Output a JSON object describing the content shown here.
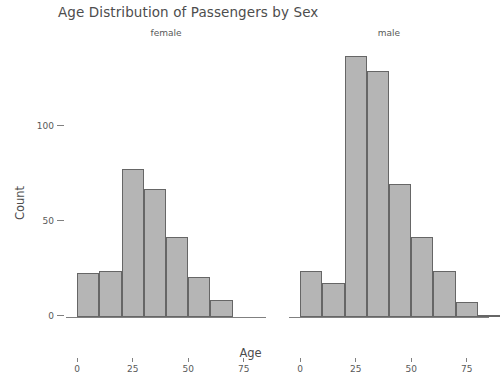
{
  "chart_data": {
    "type": "bar",
    "title": "Age Distribution of Passengers by Sex",
    "xlabel": "Age",
    "ylabel": "Count",
    "grid": false,
    "legend": "none",
    "facet_variable": "Sex",
    "bin_width": 10,
    "xlim": [
      -5,
      85
    ],
    "ylim": [
      0,
      145
    ],
    "x_ticks": [
      "0",
      "25",
      "50",
      "75"
    ],
    "x_tick_values": [
      0,
      25,
      50,
      75
    ],
    "y_ticks": [
      "0",
      "50",
      "100"
    ],
    "y_tick_values": [
      0,
      50,
      100
    ],
    "bar_fill": "#b5b5b5",
    "bar_stroke": "#666666",
    "panels": [
      {
        "label": "female",
        "bin_starts": [
          0,
          10,
          20,
          30,
          40,
          50,
          60
        ],
        "values": [
          23,
          24,
          78,
          67,
          42,
          21,
          9
        ]
      },
      {
        "label": "male",
        "bin_starts": [
          0,
          10,
          20,
          30,
          40,
          50,
          60,
          70,
          80
        ],
        "values": [
          24,
          18,
          137,
          129,
          70,
          42,
          24,
          8,
          1
        ]
      }
    ]
  }
}
